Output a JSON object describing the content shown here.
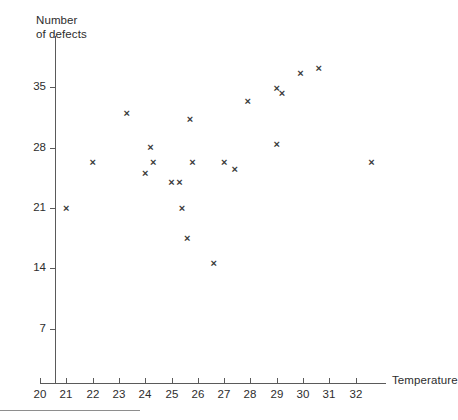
{
  "chart_data": {
    "type": "scatter",
    "title": "",
    "xlabel": "Temperature",
    "ylabel": "Number\nof defects",
    "ylabel_lines": [
      "Number",
      "of defects"
    ],
    "xlim": [
      20,
      33
    ],
    "ylim": [
      0,
      40
    ],
    "grid": false,
    "legend": null,
    "xticks": [
      20,
      21,
      22,
      23,
      24,
      25,
      26,
      27,
      28,
      29,
      30,
      31,
      32
    ],
    "xtick_labels": [
      "20",
      "21",
      "22",
      "23",
      "24",
      "25",
      "26",
      "27",
      "28",
      "29",
      "30",
      "31",
      "32"
    ],
    "yticks": [
      7,
      14,
      21,
      28,
      35
    ],
    "ytick_labels": [
      "7",
      "14",
      "21",
      "28",
      "35"
    ],
    "marker": "x",
    "marker_color": "#3a3a3a",
    "axis_color": "#5a5a5a",
    "background": "#ffffff",
    "points": [
      {
        "x": 21.0,
        "y": 21.0
      },
      {
        "x": 22.0,
        "y": 26.3
      },
      {
        "x": 23.3,
        "y": 32.0
      },
      {
        "x": 24.0,
        "y": 25.0
      },
      {
        "x": 24.2,
        "y": 28.0
      },
      {
        "x": 24.3,
        "y": 26.3
      },
      {
        "x": 25.0,
        "y": 24.0
      },
      {
        "x": 25.3,
        "y": 24.0
      },
      {
        "x": 25.4,
        "y": 21.0
      },
      {
        "x": 25.6,
        "y": 17.5
      },
      {
        "x": 25.7,
        "y": 31.3
      },
      {
        "x": 25.8,
        "y": 26.3
      },
      {
        "x": 26.6,
        "y": 14.6
      },
      {
        "x": 27.0,
        "y": 26.3
      },
      {
        "x": 27.4,
        "y": 25.5
      },
      {
        "x": 27.9,
        "y": 33.3
      },
      {
        "x": 29.0,
        "y": 28.3
      },
      {
        "x": 29.0,
        "y": 34.8
      },
      {
        "x": 29.2,
        "y": 34.3
      },
      {
        "x": 29.9,
        "y": 36.6
      },
      {
        "x": 30.6,
        "y": 37.2
      },
      {
        "x": 32.6,
        "y": 26.3
      }
    ]
  },
  "footer": {
    "note": ""
  }
}
